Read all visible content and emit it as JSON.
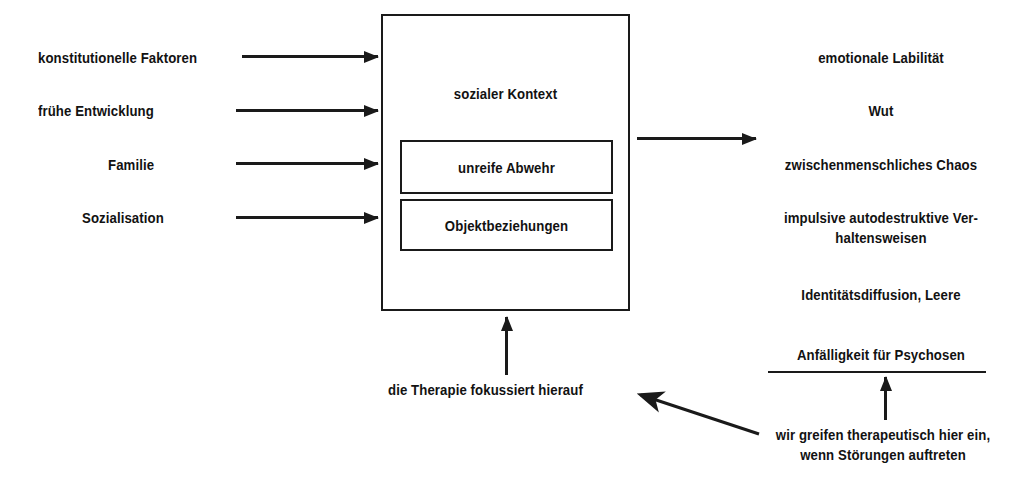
{
  "diagram": {
    "line_color": "#1a1a1a",
    "background": "#ffffff"
  },
  "inputs": {
    "items": [
      {
        "label": "konstitutionelle Faktoren"
      },
      {
        "label": "frühe Entwicklung"
      },
      {
        "label": "Familie"
      },
      {
        "label": "Sozialisation"
      }
    ]
  },
  "center": {
    "title": "sozialer Kontext",
    "inner_boxes": [
      {
        "label": "unreife Abwehr"
      },
      {
        "label": "Objektbeziehungen"
      }
    ]
  },
  "outcomes": {
    "items": [
      {
        "label": "emotionale Labilität"
      },
      {
        "label": "Wut"
      },
      {
        "label": "zwischenmenschliches Chaos"
      },
      {
        "label": "impulsive autodestruktive Ver-\nhaltensweisen"
      },
      {
        "label": "Identitätsdiffusion, Leere"
      },
      {
        "label": "Anfälligkeit für Psychosen"
      }
    ]
  },
  "annotations": {
    "therapy_focus": "die Therapie fokussiert hierauf",
    "intervention": "wir greifen therapeutisch hier\nein, wenn Störungen auftreten"
  }
}
